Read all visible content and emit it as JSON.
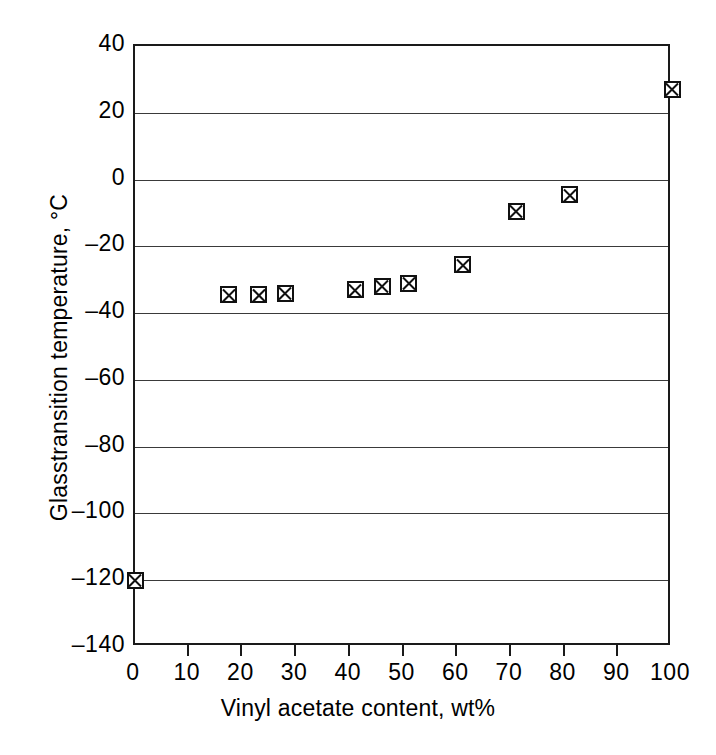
{
  "chart_data": {
    "type": "scatter",
    "title": "",
    "xlabel": "Vinyl acetate content, wt%",
    "ylabel": "Glasstransition temperature, °C",
    "xlim": [
      0,
      100
    ],
    "ylim": [
      -140,
      40
    ],
    "xticks": [
      0,
      10,
      20,
      30,
      40,
      50,
      60,
      70,
      80,
      90,
      100
    ],
    "yticks": [
      40,
      20,
      0,
      -20,
      -40,
      -60,
      -80,
      -100,
      -120,
      -140
    ],
    "xtick_labels": [
      "0",
      "10",
      "20",
      "30",
      "40",
      "50",
      "60",
      "70",
      "80",
      "90",
      "100"
    ],
    "ytick_labels": [
      "40",
      "20",
      "0",
      "–20",
      "–40",
      "–60",
      "–80",
      "–100",
      "–120",
      "–140"
    ],
    "grid": "horizontal",
    "legend": null,
    "marker_style": "square-with-x",
    "marker_color": "#111111",
    "series": [
      {
        "name": "Glass-transition temperature",
        "x": [
          0,
          17.5,
          23,
          28,
          41,
          46,
          51,
          61,
          71,
          81,
          100
        ],
        "y": [
          -120,
          -34.5,
          -34.5,
          -34,
          -33,
          -32,
          -31,
          -25.5,
          -9.5,
          -4.5,
          27
        ],
        "points": [
          {
            "x": 0,
            "y": -120
          },
          {
            "x": 17.5,
            "y": -34.5
          },
          {
            "x": 23,
            "y": -34.5
          },
          {
            "x": 28,
            "y": -34
          },
          {
            "x": 41,
            "y": -33
          },
          {
            "x": 46,
            "y": -32
          },
          {
            "x": 51,
            "y": -31
          },
          {
            "x": 61,
            "y": -25.5
          },
          {
            "x": 71,
            "y": -9.5
          },
          {
            "x": 81,
            "y": -4.5
          },
          {
            "x": 100,
            "y": 27
          }
        ]
      }
    ]
  },
  "style": {
    "axis_color": "#1a1a1a",
    "grid_color": "#3a3a3a",
    "background": "#ffffff"
  }
}
